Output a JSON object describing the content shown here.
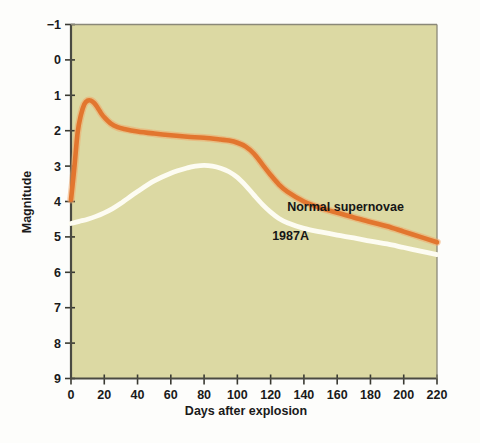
{
  "chart_data": {
    "type": "line",
    "title": "",
    "xlabel": "Days after explosion",
    "ylabel": "Magnitude",
    "xlim": [
      0,
      220
    ],
    "ylim": [
      9,
      -1
    ],
    "y_inverted": true,
    "grid": false,
    "legend": "inline-annotations",
    "plot_background": "#dcd9a3",
    "figure_background": "#fdfdfb",
    "xticks": [
      0,
      20,
      40,
      60,
      80,
      100,
      120,
      140,
      160,
      180,
      200,
      220
    ],
    "xtick_labels": [
      "0",
      "20",
      "40",
      "60",
      "80",
      "100",
      "120",
      "140",
      "160",
      "180",
      "200",
      "220"
    ],
    "yticks": [
      -1,
      0,
      1,
      2,
      3,
      4,
      5,
      6,
      7,
      8,
      9
    ],
    "ytick_labels": [
      "−1",
      "0",
      "1",
      "2",
      "3",
      "4",
      "5",
      "6",
      "7",
      "8",
      "9"
    ],
    "series": [
      {
        "name": "Normal supernovae",
        "color": "#e2762f",
        "label_x": 165,
        "label_y": 4.28,
        "x": [
          0,
          2,
          4,
          6,
          8,
          10,
          12,
          14,
          16,
          18,
          20,
          24,
          28,
          32,
          40,
          50,
          60,
          70,
          80,
          90,
          95,
          100,
          105,
          110,
          115,
          120,
          125,
          130,
          140,
          150,
          160,
          170,
          180,
          190,
          200,
          210,
          220
        ],
        "y": [
          3.95,
          3.05,
          2.05,
          1.55,
          1.25,
          1.15,
          1.15,
          1.22,
          1.35,
          1.5,
          1.62,
          1.8,
          1.9,
          1.95,
          2.02,
          2.08,
          2.13,
          2.17,
          2.2,
          2.25,
          2.28,
          2.34,
          2.45,
          2.65,
          2.95,
          3.25,
          3.52,
          3.72,
          4.0,
          4.18,
          4.32,
          4.45,
          4.58,
          4.7,
          4.85,
          5.0,
          5.15
        ]
      },
      {
        "name": "1987A",
        "color": "#fdfcf2",
        "label_x": 132,
        "label_y": 5.08,
        "x": [
          0,
          5,
          10,
          15,
          20,
          25,
          30,
          40,
          50,
          60,
          70,
          75,
          80,
          85,
          90,
          95,
          100,
          105,
          110,
          115,
          120,
          125,
          130,
          140,
          150,
          160,
          170,
          180,
          190,
          200,
          210,
          220
        ],
        "y": [
          4.62,
          4.56,
          4.5,
          4.42,
          4.32,
          4.2,
          4.05,
          3.72,
          3.42,
          3.2,
          3.05,
          3.0,
          2.98,
          3.0,
          3.06,
          3.16,
          3.32,
          3.55,
          3.82,
          4.08,
          4.3,
          4.48,
          4.6,
          4.76,
          4.86,
          4.95,
          5.03,
          5.12,
          5.2,
          5.3,
          5.4,
          5.5
        ]
      }
    ]
  }
}
